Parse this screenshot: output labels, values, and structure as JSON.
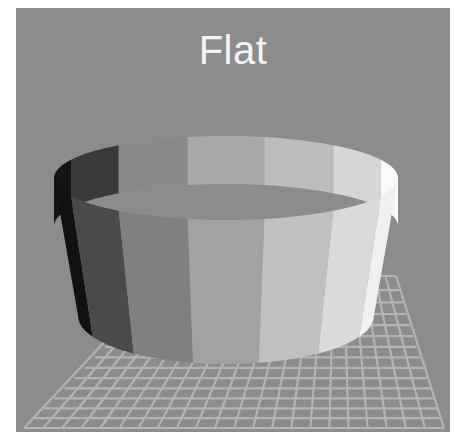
{
  "figure": {
    "title": "Flat",
    "background_color": "#8c8c8c",
    "title_color": "#f4f4f4",
    "grid_line_color": "#b4b4b4"
  },
  "cylinder": {
    "shading": "flat",
    "inner_faces": [
      "#141414",
      "#3a3a3a",
      "#8a8a8a",
      "#a8a8a8",
      "#bcbcbc",
      "#d6d6d6",
      "#fafafa"
    ],
    "outer_faces": [
      "#111111",
      "#4a4a4a",
      "#808080",
      "#a2a2a2",
      "#c0c0c0",
      "#dadada",
      "#f0f0f0"
    ]
  }
}
